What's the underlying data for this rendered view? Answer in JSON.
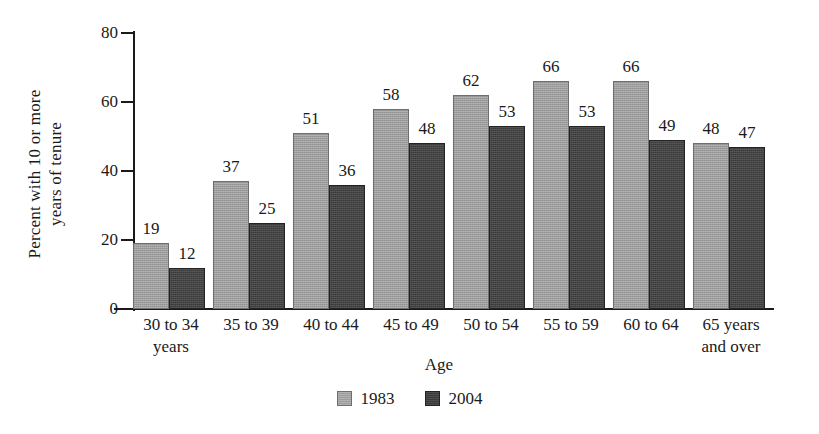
{
  "chart_data": {
    "type": "bar",
    "title": "",
    "xlabel": "Age",
    "ylabel": "Percent with 10 or more years of tenure",
    "ylabel_lines": [
      "Percent with 10 or more",
      "years of tenure"
    ],
    "ylim": [
      0,
      80
    ],
    "yticks": [
      0,
      20,
      40,
      60,
      80
    ],
    "ytick_labels": [
      "0",
      "20",
      "40",
      "60",
      "80"
    ],
    "grid": false,
    "legend_position": "bottom-center",
    "categories": [
      "30 to 34 years",
      "35 to 39",
      "40 to 44",
      "45 to 49",
      "50 to 54",
      "55 to 59",
      "60 to 64",
      "65 years and over"
    ],
    "category_lines": [
      [
        "30 to 34",
        "years"
      ],
      [
        "35 to 39",
        ""
      ],
      [
        "40 to 44",
        ""
      ],
      [
        "45 to 49",
        ""
      ],
      [
        "50 to 54",
        ""
      ],
      [
        "55 to 59",
        ""
      ],
      [
        "60 to 64",
        ""
      ],
      [
        "65 years",
        "and over"
      ]
    ],
    "series": [
      {
        "name": "1983",
        "color": "#9c9c9c",
        "values": [
          19,
          37,
          51,
          58,
          62,
          66,
          66,
          48
        ]
      },
      {
        "name": "2004",
        "color": "#3a3a3a",
        "values": [
          12,
          25,
          36,
          48,
          53,
          53,
          49,
          47
        ]
      }
    ]
  },
  "legend": {
    "items": [
      {
        "label": "1983"
      },
      {
        "label": "2004"
      }
    ]
  }
}
